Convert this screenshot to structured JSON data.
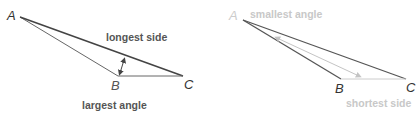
{
  "diagram": {
    "left_triangle": {
      "vertices": {
        "A": "A",
        "B": "B",
        "C": "C"
      },
      "annotations": {
        "side": "longest side",
        "angle": "largest angle"
      },
      "colors": {
        "stroke": "#555555",
        "text": "#555555",
        "vertex_text": "#333333"
      }
    },
    "right_triangle": {
      "vertices": {
        "A": "A",
        "B": "B",
        "C": "C"
      },
      "annotations": {
        "angle": "smallest angle",
        "side": "shortest side"
      },
      "colors": {
        "stroke": "#555555",
        "faded_text": "#c8c8c8",
        "vertex_text": "#333333",
        "arrow": "#c8c8c8"
      }
    }
  }
}
